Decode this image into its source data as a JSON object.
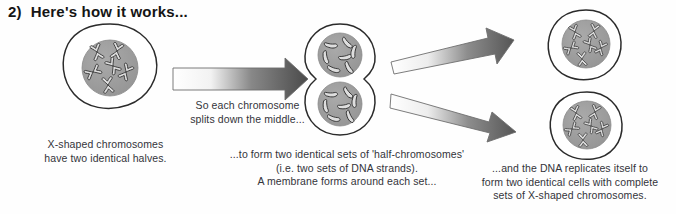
{
  "page": {
    "background_color": "#fefefe",
    "width": 676,
    "height": 214
  },
  "heading": {
    "number": "2)",
    "text": "Here's how it works..."
  },
  "captions": {
    "cell_start": "X-shaped chromosomes\nhave two identical halves.",
    "splitting": "So each chromosome\nsplits down the middle...",
    "half_chromosomes": "...to form two identical sets of 'half-chromosomes'\n(i.e. two sets of DNA strands).\nA membrane forms around each set...",
    "replication": "...and the DNA replicates itself to\nform two identical cells with complete\nsets of X-shaped chromosomes."
  },
  "diagram": {
    "type": "cell-division-illustration",
    "colors": {
      "outline": "#2b2b2b",
      "nucleus_fill": "#9b9b9b",
      "cytoplasm_fill": "#ffffff",
      "chromosome_fill": "#d8d8d8",
      "chromosome_outline": "#2f2f2f",
      "arrow_dark": "#4f4f4f",
      "arrow_light": "#ffffff",
      "arrow_outline": "#6e6e6e"
    },
    "cells": [
      {
        "name": "parent-cell",
        "label": "Parent cell with X-shaped chromosomes",
        "chromosome_count": 6,
        "chromosome_shape": "X-shaped"
      },
      {
        "name": "dividing-cell",
        "label": "Dividing cell, figure-of-eight with two nuclei",
        "chromosome_count": 7,
        "chromosome_shape": "half-chromosome strands"
      },
      {
        "name": "daughter-cell-top",
        "label": "Top daughter cell with replicated X-shaped chromosomes",
        "chromosome_count": 6,
        "chromosome_shape": "X-shaped"
      },
      {
        "name": "daughter-cell-bottom",
        "label": "Bottom daughter cell with replicated X-shaped chromosomes",
        "chromosome_count": 6,
        "chromosome_shape": "X-shaped"
      }
    ],
    "arrows": [
      {
        "name": "arrow-main",
        "direction": "right"
      },
      {
        "name": "arrow-branch-up",
        "direction": "up-right"
      },
      {
        "name": "arrow-branch-down",
        "direction": "down-right"
      }
    ]
  }
}
